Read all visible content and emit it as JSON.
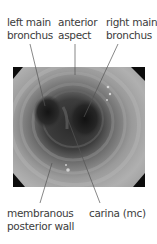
{
  "labels": {
    "left_main_bronchus": {
      "line1": "left main",
      "line2": "bronchus"
    },
    "anterior_aspect": {
      "line1": "anterior",
      "line2": "aspect"
    },
    "right_main_bronchus": {
      "line1": "right main",
      "line2": "bronchus"
    },
    "membranous_posterior_wall": {
      "line1": "membranous",
      "line2": "posterior wall"
    },
    "carina": {
      "line1": "carina (mc)"
    }
  },
  "image": {
    "description": "bronchoscopic view of trachea and main carina, grayscale"
  },
  "colors": {
    "text": "#3c3c3c",
    "leader_line": "#555555",
    "mucosa_light": "#b5b5b5",
    "mucosa_mid": "#8a8a8a",
    "lumen_dark": "#1e1e1e"
  }
}
